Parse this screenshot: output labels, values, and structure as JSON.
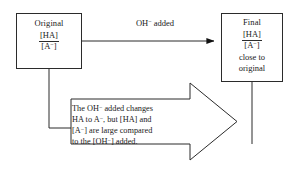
{
  "diagram": {
    "type": "buffer-action-flowchart",
    "background_color": "#ffffff",
    "stroke_color": "#2b2b2b",
    "nodes": {
      "original": {
        "title": "Original",
        "ratio_numerator": "[HA]",
        "ratio_denominator": "[A−]",
        "ratio_denominator_base": "[A",
        "ratio_denominator_charge": "−",
        "ratio_denominator_close": "]"
      },
      "final": {
        "title": "Final",
        "ratio_numerator": "[HA]",
        "ratio_denominator_base": "[A",
        "ratio_denominator_charge": "−",
        "ratio_denominator_close": "]",
        "sub_line_1": "close to",
        "sub_line_2": "original"
      }
    },
    "top_arrow": {
      "label_base": "OH",
      "label_charge": "−",
      "label_rest": " added",
      "label_full": "OH− added",
      "direction": "left-to-right"
    },
    "callout_arrow": {
      "direction": "right",
      "lines": [
        {
          "a": "The OH",
          "charge": "−",
          "b": " added changes"
        },
        {
          "a": "HA to A",
          "charge": "−",
          "b": ", but [HA] and"
        },
        {
          "a": "[A",
          "charge": "−",
          "b": "] are large compared"
        },
        {
          "a": "to the [OH",
          "charge": "−",
          "b": "] added."
        }
      ],
      "text_full": "The OH− added changes HA to A−, but [HA] and [A−] are large compared to the [OH−] added."
    }
  }
}
